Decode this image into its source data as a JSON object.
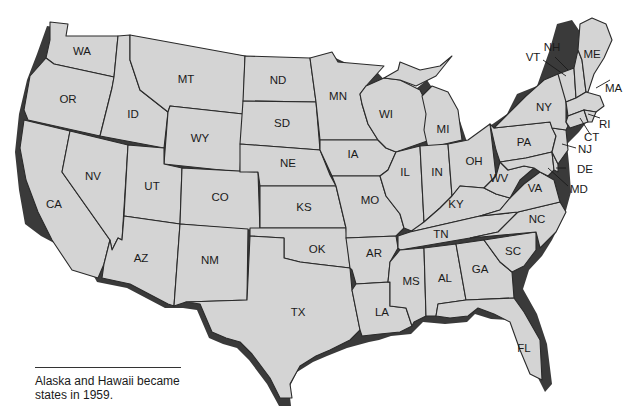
{
  "map": {
    "title": "United States (contiguous states)",
    "fill_color": "#d4d4d4",
    "border_color": "#2a2a2a",
    "shadow_color": "#3a3a3a",
    "states": [
      {
        "abbr": "WA"
      },
      {
        "abbr": "OR"
      },
      {
        "abbr": "CA"
      },
      {
        "abbr": "ID"
      },
      {
        "abbr": "NV"
      },
      {
        "abbr": "MT"
      },
      {
        "abbr": "WY"
      },
      {
        "abbr": "UT"
      },
      {
        "abbr": "AZ"
      },
      {
        "abbr": "CO"
      },
      {
        "abbr": "NM"
      },
      {
        "abbr": "ND"
      },
      {
        "abbr": "SD"
      },
      {
        "abbr": "NE"
      },
      {
        "abbr": "KS"
      },
      {
        "abbr": "OK"
      },
      {
        "abbr": "TX"
      },
      {
        "abbr": "MN"
      },
      {
        "abbr": "IA"
      },
      {
        "abbr": "MO"
      },
      {
        "abbr": "AR"
      },
      {
        "abbr": "LA"
      },
      {
        "abbr": "WI"
      },
      {
        "abbr": "IL"
      },
      {
        "abbr": "MI"
      },
      {
        "abbr": "IN"
      },
      {
        "abbr": "OH"
      },
      {
        "abbr": "KY"
      },
      {
        "abbr": "TN"
      },
      {
        "abbr": "MS"
      },
      {
        "abbr": "AL"
      },
      {
        "abbr": "GA"
      },
      {
        "abbr": "FL"
      },
      {
        "abbr": "SC"
      },
      {
        "abbr": "NC"
      },
      {
        "abbr": "VA"
      },
      {
        "abbr": "WV"
      },
      {
        "abbr": "PA"
      },
      {
        "abbr": "NY"
      },
      {
        "abbr": "VT"
      },
      {
        "abbr": "NH"
      },
      {
        "abbr": "ME"
      },
      {
        "abbr": "MA"
      },
      {
        "abbr": "RI"
      },
      {
        "abbr": "CT"
      },
      {
        "abbr": "NJ"
      },
      {
        "abbr": "DE"
      },
      {
        "abbr": "MD"
      }
    ]
  },
  "caption": {
    "text": "Alaska and Hawaii became states in 1959."
  }
}
